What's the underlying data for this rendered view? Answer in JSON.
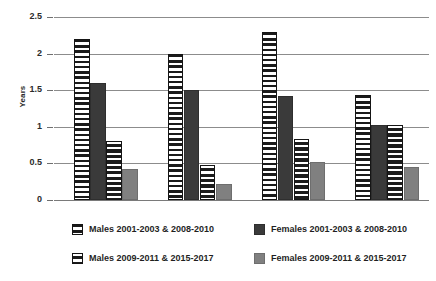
{
  "chart_data": {
    "type": "bar",
    "title": "",
    "xlabel": "",
    "ylabel": "Years",
    "ylim": [
      0,
      2.5
    ],
    "ytick_labels": [
      "0",
      "0.5",
      "1",
      "1.5",
      "2",
      "2.5"
    ],
    "ytick_values": [
      0,
      0.5,
      1,
      1.5,
      2,
      2.5
    ],
    "grid": true,
    "legend_position": "bottom",
    "categories": [
      "",
      "",
      "",
      ""
    ],
    "series": [
      {
        "name": "Males 2001-2003 & 2008-2010",
        "pattern": "horizontal-stripes-white",
        "color": "#ffffff",
        "values": [
          2.2,
          2.0,
          2.3,
          1.43
        ]
      },
      {
        "name": "Females 2001-2003 & 2008-2010",
        "pattern": "solid-dark",
        "color": "#3a3a3a",
        "values": [
          1.6,
          1.5,
          1.42,
          1.03
        ]
      },
      {
        "name": "Males 2009-2011 & 2015-2017",
        "pattern": "horizontal-stripes-dark",
        "color": "#1f1f1f",
        "values": [
          0.8,
          0.48,
          0.83,
          1.03
        ]
      },
      {
        "name": "Females 2009-2011 & 2015-2017",
        "pattern": "solid-grey",
        "color": "#808080",
        "values": [
          0.42,
          0.22,
          0.52,
          0.45
        ]
      }
    ]
  },
  "legend": {
    "rows": [
      [
        "Males 2001-2003 & 2008-2010",
        "Females 2001-2003 & 2008-2010"
      ],
      [
        "Males 2009-2011 & 2015-2017",
        "Females 2009-2011 & 2015-2017"
      ]
    ]
  }
}
